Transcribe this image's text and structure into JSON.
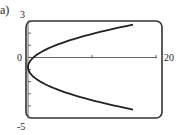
{
  "panel_label": "a)",
  "chart_data": {
    "type": "line",
    "title": "",
    "xlabel": "",
    "ylabel": "",
    "xlim": [
      0,
      20
    ],
    "ylim": [
      -5,
      3
    ],
    "x_tick_labels": [
      "0",
      "20"
    ],
    "y_tick_labels": [
      "3",
      "0",
      "-5"
    ],
    "x_ticks": [
      0,
      10,
      20
    ],
    "y_ticks": [
      -5,
      -4,
      -3,
      -2,
      -1,
      0,
      1,
      2,
      3
    ],
    "grid": false,
    "legend": null,
    "series": [
      {
        "name": "parabola (x as function of y)",
        "curve": "x = 1.34*(y + 0.8)^2",
        "points": [
          {
            "x": 16.4,
            "y": 2.7
          },
          {
            "x": 10.0,
            "y": 1.9
          },
          {
            "x": 5.0,
            "y": 1.1
          },
          {
            "x": 1.2,
            "y": 0.15
          },
          {
            "x": 0.0,
            "y": -0.8
          },
          {
            "x": 1.2,
            "y": -1.75
          },
          {
            "x": 5.0,
            "y": -2.7
          },
          {
            "x": 10.0,
            "y": -3.5
          },
          {
            "x": 16.4,
            "y": -4.3
          }
        ]
      }
    ]
  }
}
